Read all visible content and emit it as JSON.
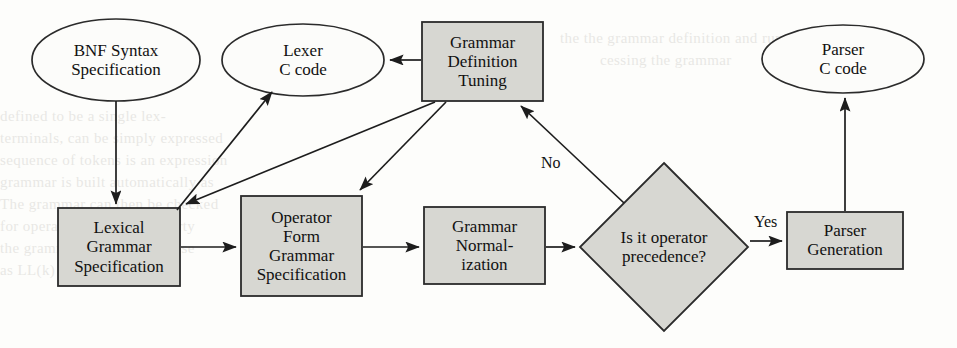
{
  "diagram": {
    "style": {
      "page_bg": "#fdfdfb",
      "node_fill": "#d7d7d2",
      "node_stroke": "#2b2b2b",
      "ellipse_fill": "#fcfcfa",
      "text_color": "#111111"
    },
    "nodes": [
      {
        "id": "bnf",
        "shape": "ellipse",
        "lines": [
          "BNF Syntax",
          "Specification"
        ],
        "cx": 116,
        "cy": 60,
        "rx": 84,
        "ry": 41,
        "font_size": 17
      },
      {
        "id": "lexer",
        "shape": "ellipse",
        "lines": [
          "Lexer",
          "C code"
        ],
        "cx": 303,
        "cy": 60,
        "rx": 81,
        "ry": 36,
        "font_size": 17
      },
      {
        "id": "gdt",
        "shape": "rect",
        "lines": [
          "Grammar",
          "Definition",
          "Tuning"
        ],
        "x": 422,
        "y": 22,
        "w": 121,
        "h": 79,
        "font_size": 17
      },
      {
        "id": "parserc",
        "shape": "ellipse",
        "lines": [
          "Parser",
          "C code"
        ],
        "cx": 843,
        "cy": 59,
        "rx": 81,
        "ry": 34,
        "font_size": 17
      },
      {
        "id": "lexgram",
        "shape": "rect",
        "lines": [
          "Lexical",
          "Grammar",
          "Specification"
        ],
        "x": 58,
        "y": 208,
        "w": 122,
        "h": 78,
        "font_size": 17
      },
      {
        "id": "opform",
        "shape": "rect",
        "lines": [
          "Operator",
          "Form",
          "Grammar",
          "Specification"
        ],
        "x": 241,
        "y": 196,
        "w": 121,
        "h": 100,
        "font_size": 17
      },
      {
        "id": "gnorm",
        "shape": "rect",
        "lines": [
          "Grammar",
          "Normal-",
          "ization"
        ],
        "x": 424,
        "y": 207,
        "w": 121,
        "h": 77,
        "font_size": 17
      },
      {
        "id": "decide",
        "shape": "diamond",
        "lines": [
          "Is it operator",
          "precedence?"
        ],
        "cx": 664,
        "cy": 247,
        "rx": 84,
        "ry": 84,
        "font_size": 17
      },
      {
        "id": "pgen",
        "shape": "rect",
        "lines": [
          "Parser",
          "Generation"
        ],
        "x": 787,
        "y": 212,
        "w": 116,
        "h": 57,
        "font_size": 17
      }
    ],
    "edges": [
      {
        "id": "bnf-to-lexgram",
        "from": "bnf",
        "to": "lexgram",
        "label": ""
      },
      {
        "id": "gdt-to-lexer",
        "from": "gdt",
        "to": "lexer",
        "label": ""
      },
      {
        "id": "gdt-to-lexgram",
        "from": "gdt",
        "to": "lexgram",
        "label": ""
      },
      {
        "id": "gdt-to-opform",
        "from": "gdt",
        "to": "opform",
        "label": ""
      },
      {
        "id": "lexgram-to-lexer",
        "from": "lexgram",
        "to": "lexer",
        "label": ""
      },
      {
        "id": "lexgram-to-opform",
        "from": "lexgram",
        "to": "opform",
        "label": ""
      },
      {
        "id": "opform-to-gnorm",
        "from": "opform",
        "to": "gnorm",
        "label": ""
      },
      {
        "id": "gnorm-to-decide",
        "from": "gnorm",
        "to": "decide",
        "label": ""
      },
      {
        "id": "decide-to-gdt",
        "from": "decide",
        "to": "gdt",
        "label": "No"
      },
      {
        "id": "decide-to-pgen",
        "from": "decide",
        "to": "pgen",
        "label": "Yes"
      },
      {
        "id": "pgen-to-parserc",
        "from": "pgen",
        "to": "parserc",
        "label": ""
      }
    ],
    "edge_labels": [
      {
        "id": "no-label",
        "text": "No",
        "x": 541,
        "y": 155
      },
      {
        "id": "yes-label",
        "text": "Yes",
        "x": 754,
        "y": 214
      }
    ],
    "background_text": [
      {
        "text": "the the grammar definition and run the",
        "x": 560,
        "y": 30,
        "size": 15
      },
      {
        "text": "cessing the grammar",
        "x": 600,
        "y": 52,
        "size": 15
      },
      {
        "text": "defined to be a single lex-",
        "x": 0,
        "y": 108,
        "size": 15
      },
      {
        "text": "terminals, can be simply expressed",
        "x": 0,
        "y": 130,
        "size": 15
      },
      {
        "text": "sequence of tokens is an expression",
        "x": 0,
        "y": 152,
        "size": 15
      },
      {
        "text": "grammar is built automatically as",
        "x": 0,
        "y": 174,
        "size": 15
      },
      {
        "text": "The grammar can then be checked",
        "x": 0,
        "y": 196,
        "size": 15
      },
      {
        "text": "for operator grammar property",
        "x": 0,
        "y": 218,
        "size": 15
      },
      {
        "text": "the grammar can usually parse",
        "x": 0,
        "y": 240,
        "size": 15
      },
      {
        "text": "as LL(k) decision [4]",
        "x": 0,
        "y": 262,
        "size": 15
      }
    ]
  }
}
